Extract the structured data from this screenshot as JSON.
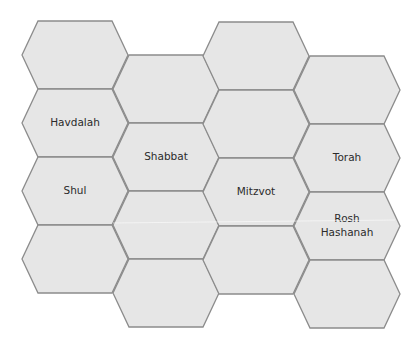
{
  "diagram": {
    "type": "hexagon-grid",
    "colors": {
      "fill": "#e6e6e6",
      "stroke": "#8c8c8c",
      "text": "#2b2b2b"
    },
    "hex_size": {
      "width": 106,
      "height": 68,
      "edge_inset": 16
    },
    "cells": [
      {
        "col": 0,
        "row": 0,
        "x": 22,
        "y": 21,
        "label": ""
      },
      {
        "col": 0,
        "row": 1,
        "x": 22,
        "y": 89,
        "label": "Havdalah"
      },
      {
        "col": 0,
        "row": 2,
        "x": 22,
        "y": 157,
        "label": "Shul"
      },
      {
        "col": 0,
        "row": 3,
        "x": 22,
        "y": 225,
        "label": ""
      },
      {
        "col": 1,
        "row": 0,
        "x": 113,
        "y": 55,
        "label": ""
      },
      {
        "col": 1,
        "row": 1,
        "x": 113,
        "y": 123,
        "label": "Shabbat"
      },
      {
        "col": 1,
        "row": 2,
        "x": 113,
        "y": 191,
        "label": ""
      },
      {
        "col": 1,
        "row": 3,
        "x": 113,
        "y": 259,
        "label": ""
      },
      {
        "col": 2,
        "row": 0,
        "x": 203,
        "y": 22,
        "label": ""
      },
      {
        "col": 2,
        "row": 1,
        "x": 203,
        "y": 90,
        "label": ""
      },
      {
        "col": 2,
        "row": 2,
        "x": 203,
        "y": 158,
        "label": "Mitzvot"
      },
      {
        "col": 2,
        "row": 3,
        "x": 203,
        "y": 226,
        "label": ""
      },
      {
        "col": 3,
        "row": 0,
        "x": 294,
        "y": 56,
        "label": ""
      },
      {
        "col": 3,
        "row": 1,
        "x": 294,
        "y": 124,
        "label": "Torah"
      },
      {
        "col": 3,
        "row": 2,
        "x": 294,
        "y": 192,
        "label": "Rosh Hashanah",
        "lines": [
          "Rosh",
          "Hashanah"
        ]
      },
      {
        "col": 3,
        "row": 3,
        "x": 294,
        "y": 260,
        "label": ""
      }
    ]
  }
}
